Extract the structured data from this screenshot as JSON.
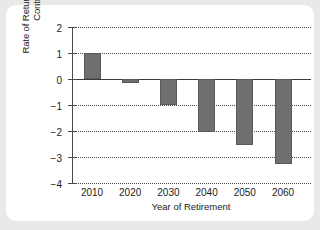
{
  "chart_data": {
    "type": "bar",
    "title": "",
    "xlabel": "Year of Retirement",
    "ylabel": "Rate of Return on Social Security Contributions (%)",
    "categories": [
      "2010",
      "2020",
      "2030",
      "2040",
      "2050",
      "2060"
    ],
    "values": [
      1.0,
      -0.15,
      -1.0,
      -2.05,
      -2.55,
      -3.25
    ],
    "ylim": [
      -4,
      2
    ],
    "yticks": [
      2,
      1,
      0,
      -1,
      -2,
      -3,
      -4
    ],
    "ytick_labels": [
      "2",
      "1",
      "0",
      "−1",
      "−2",
      "−3",
      "−4"
    ],
    "grid": true,
    "grid_style": "dotted-horizontal",
    "legend": "none",
    "bar_color": "#6f6f6f",
    "zero_line_color": "#3a3a3a",
    "axis_color": "#4a4a4a",
    "background_color": "#ffffff",
    "page_background_color": "#e9e9e7"
  },
  "figure": {
    "y_axis_title": "Rate of Return on Social Security Contributions (%)",
    "x_axis_title": "Year of Retirement"
  }
}
